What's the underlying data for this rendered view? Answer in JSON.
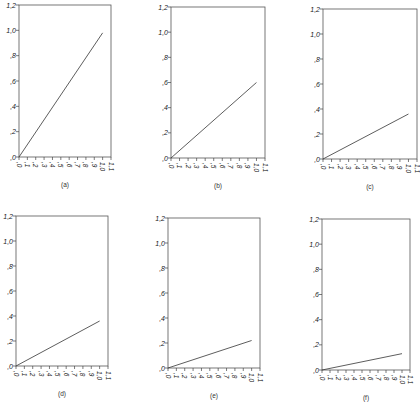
{
  "figure": {
    "y_tick_labels": [
      ",0",
      ",2",
      ",4",
      ",6",
      ",8",
      "1,0",
      "1,2"
    ],
    "x_tick_labels": [
      ",0",
      ",1",
      ",2",
      ",3",
      ",4",
      ",5",
      ",6",
      ",7",
      ",8",
      ",9",
      "1,0",
      "1,1"
    ],
    "panels": [
      {
        "caption": "(a)",
        "left": 19,
        "top": 5,
        "right": 111,
        "bottom": 157,
        "slope": 0.98
      },
      {
        "caption": "(b)",
        "left": 171,
        "top": 7,
        "right": 265,
        "bottom": 158,
        "slope": 0.6
      },
      {
        "caption": "(c)",
        "left": 323,
        "top": 9,
        "right": 417,
        "bottom": 159,
        "slope": 0.36
      },
      {
        "caption": "(d)",
        "left": 16,
        "top": 216,
        "right": 108,
        "bottom": 366,
        "slope": 0.36
      },
      {
        "caption": "(e)",
        "left": 168,
        "top": 218,
        "right": 260,
        "bottom": 368,
        "slope": 0.22
      },
      {
        "caption": "(f)",
        "left": 322,
        "top": 219,
        "right": 410,
        "bottom": 370,
        "slope": 0.13
      }
    ]
  },
  "chart_data": [
    {
      "type": "line",
      "title": "(a)",
      "xlabel": "",
      "ylabel": "",
      "xlim": [
        0,
        1.1
      ],
      "ylim": [
        0,
        1.2
      ],
      "grid": false,
      "x": [
        0,
        1.0
      ],
      "series": [
        {
          "name": "line",
          "values": [
            0,
            0.98
          ]
        }
      ],
      "x_ticks": [
        0,
        0.1,
        0.2,
        0.3,
        0.4,
        0.5,
        0.6,
        0.7,
        0.8,
        0.9,
        1.0,
        1.1
      ],
      "y_ticks": [
        0,
        0.2,
        0.4,
        0.6,
        0.8,
        1.0,
        1.2
      ]
    },
    {
      "type": "line",
      "title": "(b)",
      "xlabel": "",
      "ylabel": "",
      "xlim": [
        0,
        1.1
      ],
      "ylim": [
        0,
        1.2
      ],
      "grid": false,
      "x": [
        0,
        1.0
      ],
      "series": [
        {
          "name": "line",
          "values": [
            0,
            0.6
          ]
        }
      ],
      "x_ticks": [
        0,
        0.1,
        0.2,
        0.3,
        0.4,
        0.5,
        0.6,
        0.7,
        0.8,
        0.9,
        1.0,
        1.1
      ],
      "y_ticks": [
        0,
        0.2,
        0.4,
        0.6,
        0.8,
        1.0,
        1.2
      ]
    },
    {
      "type": "line",
      "title": "(c)",
      "xlabel": "",
      "ylabel": "",
      "xlim": [
        0,
        1.1
      ],
      "ylim": [
        0,
        1.2
      ],
      "grid": false,
      "x": [
        0,
        1.0
      ],
      "series": [
        {
          "name": "line",
          "values": [
            0,
            0.36
          ]
        }
      ],
      "x_ticks": [
        0,
        0.1,
        0.2,
        0.3,
        0.4,
        0.5,
        0.6,
        0.7,
        0.8,
        0.9,
        1.0,
        1.1
      ],
      "y_ticks": [
        0,
        0.2,
        0.4,
        0.6,
        0.8,
        1.0,
        1.2
      ]
    },
    {
      "type": "line",
      "title": "(d)",
      "xlabel": "",
      "ylabel": "",
      "xlim": [
        0,
        1.1
      ],
      "ylim": [
        0,
        1.2
      ],
      "grid": false,
      "x": [
        0,
        1.0
      ],
      "series": [
        {
          "name": "line",
          "values": [
            0,
            0.36
          ]
        }
      ],
      "x_ticks": [
        0,
        0.1,
        0.2,
        0.3,
        0.4,
        0.5,
        0.6,
        0.7,
        0.8,
        0.9,
        1.0,
        1.1
      ],
      "y_ticks": [
        0,
        0.2,
        0.4,
        0.6,
        0.8,
        1.0,
        1.2
      ]
    },
    {
      "type": "line",
      "title": "(e)",
      "xlabel": "",
      "ylabel": "",
      "xlim": [
        0,
        1.1
      ],
      "ylim": [
        0,
        1.2
      ],
      "grid": false,
      "x": [
        0,
        1.0
      ],
      "series": [
        {
          "name": "line",
          "values": [
            0,
            0.22
          ]
        }
      ],
      "x_ticks": [
        0,
        0.1,
        0.2,
        0.3,
        0.4,
        0.5,
        0.6,
        0.7,
        0.8,
        0.9,
        1.0,
        1.1
      ],
      "y_ticks": [
        0,
        0.2,
        0.4,
        0.6,
        0.8,
        1.0,
        1.2
      ]
    },
    {
      "type": "line",
      "title": "(f)",
      "xlabel": "",
      "ylabel": "",
      "xlim": [
        0,
        1.1
      ],
      "ylim": [
        0,
        1.2
      ],
      "grid": false,
      "x": [
        0,
        1.0
      ],
      "series": [
        {
          "name": "line",
          "values": [
            0,
            0.13
          ]
        }
      ],
      "x_ticks": [
        0,
        0.1,
        0.2,
        0.3,
        0.4,
        0.5,
        0.6,
        0.7,
        0.8,
        0.9,
        1.0,
        1.1
      ],
      "y_ticks": [
        0,
        0.2,
        0.4,
        0.6,
        0.8,
        1.0,
        1.2
      ]
    }
  ]
}
